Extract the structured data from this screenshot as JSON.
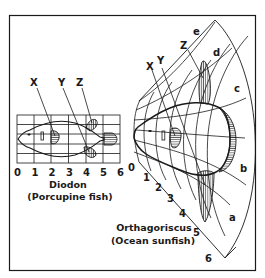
{
  "figure": {
    "colors": {
      "ink": "#1a1a1a",
      "background": "#ffffff"
    },
    "diodon": {
      "name": "Diodon",
      "common_name": "(Porcupine fish)",
      "x_ticks": [
        "0",
        "1",
        "2",
        "3",
        "4",
        "5",
        "6"
      ],
      "fin_labels": [
        "X",
        "Y",
        "Z"
      ]
    },
    "orthagoriscus": {
      "name": "Orthagoriscus",
      "common_name": "(Ocean sunfish)",
      "radial_ticks": [
        "0",
        "1",
        "2",
        "3",
        "4",
        "5",
        "6"
      ],
      "arc_labels": [
        "a",
        "b",
        "c",
        "d",
        "e"
      ],
      "fin_labels": [
        "X",
        "Y",
        "Z"
      ]
    }
  }
}
